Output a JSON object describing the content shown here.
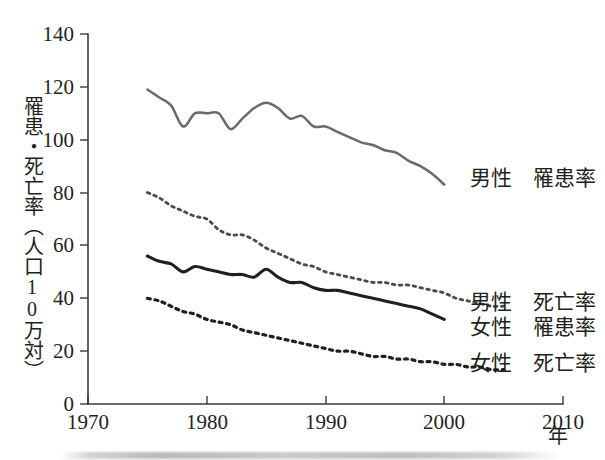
{
  "chart_data": {
    "type": "line",
    "title": "",
    "xlabel": "年",
    "ylabel": "罹患・死亡率（人口10万対）",
    "xlim": [
      1970,
      2010
    ],
    "ylim": [
      0,
      140
    ],
    "grid": false,
    "legend_position": "right-inline",
    "xticks": [
      1970,
      1980,
      1990,
      2000,
      2010
    ],
    "yticks": [
      0,
      20,
      40,
      60,
      80,
      100,
      120,
      140
    ],
    "series": [
      {
        "name": "男性　罹患率",
        "style": "solid",
        "color": "#6a6a6a",
        "x": [
          1975,
          1976,
          1977,
          1978,
          1979,
          1980,
          1981,
          1982,
          1983,
          1984,
          1985,
          1986,
          1987,
          1988,
          1989,
          1990,
          1991,
          1992,
          1993,
          1994,
          1995,
          1996,
          1997,
          1998,
          1999,
          2000
        ],
        "values": [
          119,
          116,
          113,
          105,
          110,
          110,
          110,
          104,
          108,
          112,
          114,
          112,
          108,
          109,
          105,
          105,
          103,
          101,
          99,
          98,
          96,
          95,
          92,
          90,
          87,
          83
        ]
      },
      {
        "name": "女性　罹患率",
        "style": "dotted",
        "color": "#4a4a4a",
        "x": [
          1975,
          1976,
          1977,
          1978,
          1979,
          1980,
          1981,
          1982,
          1983,
          1984,
          1985,
          1986,
          1987,
          1988,
          1989,
          1990,
          1991,
          1992,
          1993,
          1994,
          1995,
          1996,
          1997,
          1998,
          1999,
          2000,
          2001,
          2002,
          2003,
          2004,
          2005
        ],
        "values": [
          80,
          78,
          75,
          73,
          71,
          70,
          66,
          64,
          64,
          62,
          59,
          57,
          55,
          53,
          52,
          50,
          49,
          48,
          47,
          46,
          46,
          45,
          45,
          44,
          43,
          42,
          40,
          39,
          38,
          37,
          37
        ]
      },
      {
        "name": "男性　死亡率",
        "style": "solid-bold",
        "color": "#231f20",
        "x": [
          1975,
          1976,
          1977,
          1978,
          1979,
          1980,
          1981,
          1982,
          1983,
          1984,
          1985,
          1986,
          1987,
          1988,
          1989,
          1990,
          1991,
          1992,
          1993,
          1994,
          1995,
          1996,
          1997,
          1998,
          1999,
          2000
        ],
        "values": [
          56,
          54,
          53,
          50,
          52,
          51,
          50,
          49,
          49,
          48,
          51,
          48,
          46,
          46,
          44,
          43,
          43,
          42,
          41,
          40,
          39,
          38,
          37,
          36,
          34,
          32
        ]
      },
      {
        "name": "女性　死亡率",
        "style": "dotted-bold",
        "color": "#231f20",
        "x": [
          1975,
          1976,
          1977,
          1978,
          1979,
          1980,
          1981,
          1982,
          1983,
          1984,
          1985,
          1986,
          1987,
          1988,
          1989,
          1990,
          1991,
          1992,
          1993,
          1994,
          1995,
          1996,
          1997,
          1998,
          1999,
          2000,
          2001,
          2002,
          2003,
          2004,
          2005
        ],
        "values": [
          40,
          39,
          37,
          35,
          34,
          32,
          31,
          30,
          28,
          27,
          26,
          25,
          24,
          23,
          22,
          21,
          20,
          20,
          19,
          18,
          18,
          17,
          17,
          16,
          16,
          15,
          15,
          14,
          14,
          13,
          13
        ]
      }
    ]
  },
  "axis": {
    "y_title": "罹患・死亡率（人口10万対）",
    "x_title": "年",
    "y_labels": [
      "140",
      "120",
      "100",
      "80",
      "60",
      "40",
      "20",
      "0"
    ],
    "x_labels": [
      "1970",
      "1980",
      "1990",
      "2000",
      "2010"
    ]
  },
  "legend": {
    "male_incidence": "男性　罹患率",
    "male_mortality": "男性　死亡率",
    "female_incidence": "女性　罹患率",
    "female_mortality": "女性　死亡率"
  }
}
